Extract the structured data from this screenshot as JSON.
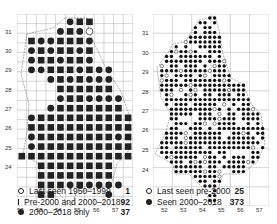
{
  "left_map": {
    "y_labels": [
      "31",
      "30",
      "29",
      "28",
      "27",
      "26",
      "25",
      "24"
    ],
    "x_labels": [
      "52",
      "53",
      "54",
      "55",
      "56",
      "57"
    ],
    "legend": [
      {
        "symbol": "circle-open",
        "label": "Last seen 1950–1999",
        "count": "1"
      },
      {
        "symbol": "square",
        "label": "Pre-2000 and 2000–2018",
        "count": "92"
      },
      {
        "symbol": "circle",
        "label": "2000–2018 only",
        "count": "37"
      }
    ],
    "cells": [
      [
        0,
        5,
        "c"
      ],
      [
        0,
        6,
        "s"
      ],
      [
        0,
        7,
        "s"
      ],
      [
        1,
        4,
        "c"
      ],
      [
        1,
        5,
        "s"
      ],
      [
        1,
        6,
        "c"
      ],
      [
        1,
        7,
        "o"
      ],
      [
        2,
        1,
        "s"
      ],
      [
        2,
        2,
        "c"
      ],
      [
        2,
        3,
        "c"
      ],
      [
        2,
        4,
        "s"
      ],
      [
        2,
        5,
        "s"
      ],
      [
        2,
        6,
        "s"
      ],
      [
        2,
        7,
        "c"
      ],
      [
        3,
        1,
        "c"
      ],
      [
        3,
        2,
        "s"
      ],
      [
        3,
        3,
        "c"
      ],
      [
        3,
        4,
        "s"
      ],
      [
        3,
        5,
        "s"
      ],
      [
        3,
        6,
        "c"
      ],
      [
        3,
        7,
        "s"
      ],
      [
        4,
        1,
        "c"
      ],
      [
        4,
        2,
        "s"
      ],
      [
        4,
        3,
        "s"
      ],
      [
        4,
        4,
        "c"
      ],
      [
        4,
        5,
        "s"
      ],
      [
        4,
        6,
        "s"
      ],
      [
        4,
        7,
        "c"
      ],
      [
        5,
        1,
        "c"
      ],
      [
        5,
        2,
        "c"
      ],
      [
        5,
        3,
        "s"
      ],
      [
        5,
        4,
        "s"
      ],
      [
        5,
        5,
        "s"
      ],
      [
        5,
        6,
        "c"
      ],
      [
        5,
        7,
        "s"
      ],
      [
        5,
        8,
        "c"
      ],
      [
        5,
        9,
        "c"
      ],
      [
        6,
        3,
        "c"
      ],
      [
        6,
        4,
        "s"
      ],
      [
        6,
        5,
        "c"
      ],
      [
        6,
        6,
        "s"
      ],
      [
        6,
        7,
        "c"
      ],
      [
        6,
        8,
        "c"
      ],
      [
        6,
        9,
        "c"
      ],
      [
        7,
        4,
        "s"
      ],
      [
        7,
        5,
        "s"
      ],
      [
        7,
        6,
        "s"
      ],
      [
        7,
        7,
        "s"
      ],
      [
        7,
        8,
        "s"
      ],
      [
        7,
        9,
        "s"
      ],
      [
        8,
        4,
        "c"
      ],
      [
        8,
        5,
        "s"
      ],
      [
        8,
        6,
        "s"
      ],
      [
        8,
        7,
        "c"
      ],
      [
        8,
        8,
        "c"
      ],
      [
        8,
        9,
        "c"
      ],
      [
        8,
        10,
        "c"
      ],
      [
        9,
        3,
        "c"
      ],
      [
        9,
        4,
        "s"
      ],
      [
        9,
        5,
        "s"
      ],
      [
        9,
        6,
        "s"
      ],
      [
        9,
        7,
        "s"
      ],
      [
        9,
        8,
        "s"
      ],
      [
        9,
        9,
        "s"
      ],
      [
        9,
        10,
        "s"
      ],
      [
        10,
        1,
        "c"
      ],
      [
        10,
        2,
        "s"
      ],
      [
        10,
        3,
        "s"
      ],
      [
        10,
        4,
        "s"
      ],
      [
        10,
        5,
        "s"
      ],
      [
        10,
        6,
        "s"
      ],
      [
        10,
        7,
        "s"
      ],
      [
        10,
        8,
        "s"
      ],
      [
        10,
        9,
        "s"
      ],
      [
        10,
        10,
        "s"
      ],
      [
        10,
        11,
        "s"
      ],
      [
        11,
        1,
        "s"
      ],
      [
        11,
        2,
        "s"
      ],
      [
        11,
        3,
        "s"
      ],
      [
        11,
        4,
        "s"
      ],
      [
        11,
        5,
        "s"
      ],
      [
        11,
        6,
        "s"
      ],
      [
        11,
        7,
        "s"
      ],
      [
        11,
        8,
        "s"
      ],
      [
        11,
        9,
        "s"
      ],
      [
        11,
        10,
        "s"
      ],
      [
        11,
        11,
        "s"
      ],
      [
        12,
        1,
        "c"
      ],
      [
        12,
        2,
        "s"
      ],
      [
        12,
        3,
        "s"
      ],
      [
        12,
        4,
        "s"
      ],
      [
        12,
        5,
        "s"
      ],
      [
        12,
        6,
        "s"
      ],
      [
        12,
        7,
        "s"
      ],
      [
        12,
        8,
        "s"
      ],
      [
        12,
        9,
        "s"
      ],
      [
        12,
        10,
        "c"
      ],
      [
        12,
        11,
        "s"
      ],
      [
        13,
        1,
        "c"
      ],
      [
        13,
        2,
        "s"
      ],
      [
        13,
        3,
        "s"
      ],
      [
        13,
        4,
        "s"
      ],
      [
        13,
        5,
        "s"
      ],
      [
        13,
        6,
        "s"
      ],
      [
        13,
        7,
        "s"
      ],
      [
        13,
        8,
        "s"
      ],
      [
        13,
        9,
        "s"
      ],
      [
        13,
        10,
        "s"
      ],
      [
        13,
        11,
        "s"
      ],
      [
        14,
        0,
        "s"
      ],
      [
        14,
        1,
        "s"
      ],
      [
        14,
        2,
        "s"
      ],
      [
        14,
        3,
        "s"
      ],
      [
        14,
        4,
        "s"
      ],
      [
        14,
        5,
        "s"
      ],
      [
        14,
        6,
        "s"
      ],
      [
        14,
        7,
        "s"
      ],
      [
        14,
        8,
        "s"
      ],
      [
        14,
        9,
        "s"
      ],
      [
        14,
        10,
        "s"
      ],
      [
        14,
        11,
        "s"
      ],
      [
        15,
        2,
        "s"
      ],
      [
        15,
        3,
        "s"
      ],
      [
        15,
        4,
        "s"
      ],
      [
        15,
        5,
        "s"
      ],
      [
        15,
        6,
        "s"
      ],
      [
        15,
        7,
        "s"
      ],
      [
        15,
        8,
        "s"
      ],
      [
        15,
        9,
        "s"
      ],
      [
        16,
        2,
        "s"
      ],
      [
        16,
        3,
        "s"
      ],
      [
        16,
        4,
        "s"
      ],
      [
        16,
        5,
        "s"
      ],
      [
        16,
        6,
        "s"
      ],
      [
        16,
        7,
        "s"
      ],
      [
        16,
        8,
        "s"
      ],
      [
        16,
        9,
        "s"
      ],
      [
        17,
        2,
        "s"
      ],
      [
        17,
        3,
        "s"
      ],
      [
        17,
        4,
        "s"
      ],
      [
        17,
        5,
        "c"
      ],
      [
        17,
        6,
        "s"
      ],
      [
        17,
        7,
        "c"
      ],
      [
        17,
        8,
        "c"
      ],
      [
        17,
        9,
        "c"
      ],
      [
        17,
        10,
        "c"
      ],
      [
        18,
        2,
        "s"
      ],
      [
        18,
        3,
        "s"
      ],
      [
        18,
        9,
        "c"
      ]
    ]
  },
  "right_map": {
    "y_labels": [
      "31",
      "30",
      "29",
      "28",
      "27",
      "26",
      "25",
      "24"
    ],
    "x_labels": [
      "52",
      "53",
      "54",
      "55",
      "56",
      "57"
    ],
    "legend": [
      {
        "symbol": "circle-open",
        "label": "Last seen pre-2000",
        "count": "25"
      },
      {
        "symbol": "circle",
        "label": "Seen 2000–2018",
        "count": "373"
      }
    ]
  }
}
